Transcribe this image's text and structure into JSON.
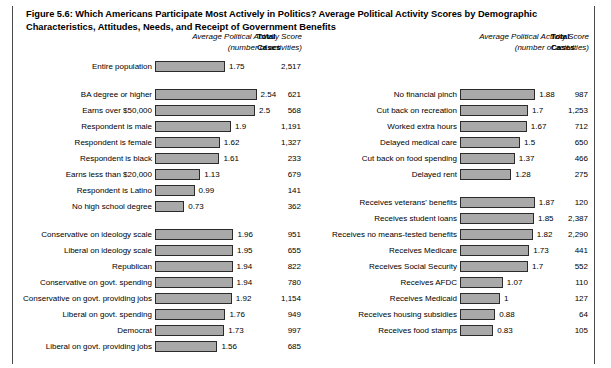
{
  "figure": {
    "label": "Figure 5.6",
    "title": ": Which Americans Participate Most Actively in Politics? Average Political Activity Scores by Demographic Characteristics, Attitudes, Needs, and Receipt of Government Benefits",
    "headers": {
      "score_line1": "Average Political Activity Score",
      "score_line2": "(number of activities)",
      "total_line1": "Total",
      "total_line2": "Cases"
    }
  },
  "chart_data": {
    "type": "bar",
    "title": "Figure 5.6: Which Americans Participate Most Actively in Politics? Average Political Activity Scores by Demographic Characteristics, Attitudes, Needs, and Receipt of Government Benefits",
    "xlabel": "Average Political Activity Score (number of activities)",
    "ylabel": "",
    "xlim": [
      0,
      2.6
    ],
    "grid": false,
    "orientation": "horizontal",
    "value_column": "Average Political Activity Score (number of activities)",
    "count_column": "Total Cases",
    "left_column": [
      {
        "group": "overall",
        "rows": [
          {
            "category": "Entire population",
            "value": 1.75,
            "value_text": "1.75",
            "cases": 2517,
            "cases_text": "2,517"
          }
        ]
      },
      {
        "group": "demographics",
        "rows": [
          {
            "category": "BA degree or higher",
            "value": 2.54,
            "value_text": "2.54",
            "cases": 621,
            "cases_text": "621"
          },
          {
            "category": "Earns over $50,000",
            "value": 2.5,
            "value_text": "2.5",
            "cases": 568,
            "cases_text": "568"
          },
          {
            "category": "Respondent is male",
            "value": 1.9,
            "value_text": "1.9",
            "cases": 1191,
            "cases_text": "1,191"
          },
          {
            "category": "Respondent is female",
            "value": 1.62,
            "value_text": "1.62",
            "cases": 1327,
            "cases_text": "1,327"
          },
          {
            "category": "Respondent is black",
            "value": 1.61,
            "value_text": "1.61",
            "cases": 233,
            "cases_text": "233"
          },
          {
            "category": "Earns less than $20,000",
            "value": 1.13,
            "value_text": "1.13",
            "cases": 679,
            "cases_text": "679"
          },
          {
            "category": "Respondent is Latino",
            "value": 0.99,
            "value_text": "0.99",
            "cases": 141,
            "cases_text": "141"
          },
          {
            "category": "No high school degree",
            "value": 0.73,
            "value_text": "0.73",
            "cases": 362,
            "cases_text": "362"
          }
        ]
      },
      {
        "group": "attitudes",
        "rows": [
          {
            "category": "Conservative on ideology scale",
            "value": 1.96,
            "value_text": "1.96",
            "cases": 951,
            "cases_text": "951"
          },
          {
            "category": "Liberal on ideology scale",
            "value": 1.95,
            "value_text": "1.95",
            "cases": 655,
            "cases_text": "655"
          },
          {
            "category": "Republican",
            "value": 1.94,
            "value_text": "1.94",
            "cases": 822,
            "cases_text": "822"
          },
          {
            "category": "Conservative on govt. spending",
            "value": 1.94,
            "value_text": "1.94",
            "cases": 780,
            "cases_text": "780"
          },
          {
            "category": "Conservative on govt. providing jobs",
            "value": 1.92,
            "value_text": "1.92",
            "cases": 1154,
            "cases_text": "1,154"
          },
          {
            "category": "Liberal on govt. spending",
            "value": 1.76,
            "value_text": "1.76",
            "cases": 949,
            "cases_text": "949"
          },
          {
            "category": "Democrat",
            "value": 1.73,
            "value_text": "1.73",
            "cases": 997,
            "cases_text": "997"
          },
          {
            "category": "Liberal on govt. providing jobs",
            "value": 1.56,
            "value_text": "1.56",
            "cases": 685,
            "cases_text": "685"
          }
        ]
      }
    ],
    "right_column": [
      {
        "group": "needs",
        "rows": [
          {
            "category": "No financial pinch",
            "value": 1.88,
            "value_text": "1.88",
            "cases": 987,
            "cases_text": "987"
          },
          {
            "category": "Cut back on recreation",
            "value": 1.7,
            "value_text": "1.7",
            "cases": 1253,
            "cases_text": "1,253"
          },
          {
            "category": "Worked extra hours",
            "value": 1.67,
            "value_text": "1.67",
            "cases": 712,
            "cases_text": "712"
          },
          {
            "category": "Delayed medical care",
            "value": 1.5,
            "value_text": "1.5",
            "cases": 650,
            "cases_text": "650"
          },
          {
            "category": "Cut back on food spending",
            "value": 1.37,
            "value_text": "1.37",
            "cases": 466,
            "cases_text": "466"
          },
          {
            "category": "Delayed rent",
            "value": 1.28,
            "value_text": "1.28",
            "cases": 275,
            "cases_text": "275"
          }
        ]
      },
      {
        "group": "benefits",
        "rows": [
          {
            "category": "Receives veterans' benefits",
            "value": 1.87,
            "value_text": "1.87",
            "cases": 120,
            "cases_text": "120"
          },
          {
            "category": "Receives student loans",
            "value": 1.85,
            "value_text": "1.85",
            "cases": 2387,
            "cases_text": "2,387"
          },
          {
            "category": "Receives no means-tested benefits",
            "value": 1.82,
            "value_text": "1.82",
            "cases": 2290,
            "cases_text": "2,290"
          },
          {
            "category": "Receives Medicare",
            "value": 1.73,
            "value_text": "1.73",
            "cases": 441,
            "cases_text": "441"
          },
          {
            "category": "Receives Social Security",
            "value": 1.7,
            "value_text": "1.7",
            "cases": 552,
            "cases_text": "552"
          },
          {
            "category": "Receives AFDC",
            "value": 1.07,
            "value_text": "1.07",
            "cases": 110,
            "cases_text": "110"
          },
          {
            "category": "Receives Medicaid",
            "value": 1,
            "value_text": "1",
            "cases": 127,
            "cases_text": "127"
          },
          {
            "category": "Receives housing subsidies",
            "value": 0.88,
            "value_text": "0.88",
            "cases": 64,
            "cases_text": "64"
          },
          {
            "category": "Receives food stamps",
            "value": 0.83,
            "value_text": "0.83",
            "cases": 105,
            "cases_text": "105"
          }
        ]
      }
    ],
    "style": {
      "bar_fill": "#a9a9a9",
      "bar_border": "#2b2b2b",
      "background": "#ffffff",
      "text": "#000000"
    }
  }
}
